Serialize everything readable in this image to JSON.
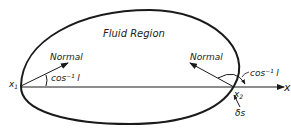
{
  "diagram": {
    "region_label": "Fluid Region",
    "left_point": {
      "label": "x",
      "subscript": "1",
      "normal_label": "Normal",
      "angle_label": "cos⁻¹ l"
    },
    "right_point": {
      "label": "x",
      "subscript": "2",
      "normal_label": "Normal",
      "angle_label": "cos⁻¹ l",
      "arc_label": "δs"
    },
    "axis_label": "x",
    "stroke_color": "#1a1a1a"
  }
}
